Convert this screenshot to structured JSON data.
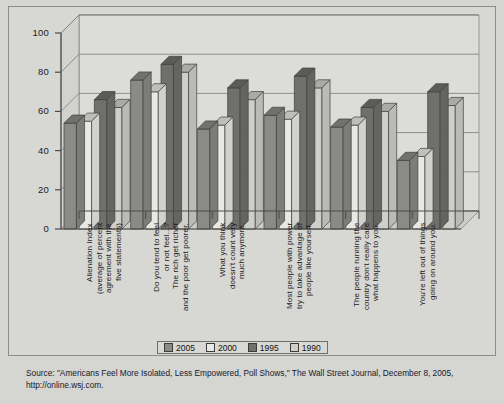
{
  "chart_data": {
    "type": "bar",
    "title": "",
    "xlabel": "",
    "ylabel": "",
    "ylim": [
      0,
      100
    ],
    "yticks": [
      0,
      20,
      40,
      60,
      80,
      100
    ],
    "grid": true,
    "legend_position": "bottom",
    "style": "3d-grouped-columns",
    "categories": [
      "Alienation Index\n(average of percent\nagreement with the\nfive statements)",
      "Do you tend to feel\nor not feel...?\nThe rich get richer\nand the poor get poorer.",
      "What you think\ndoesn't count very\nmuch anymore.",
      "Most people with power\ntry to take advantage of\npeople like yourself.",
      "The people running the\ncountry don't really care\nwhat happens to you.",
      "You're left out of things\ngoing on around you."
    ],
    "series": [
      {
        "name": "2005",
        "color": "#8a8a87",
        "values": [
          54,
          76,
          51,
          58,
          52,
          35
        ]
      },
      {
        "name": "2000",
        "color": "#e8e8e4",
        "values": [
          55,
          70,
          53,
          56,
          53,
          37
        ]
      },
      {
        "name": "1995",
        "color": "#6f6f6c",
        "values": [
          66,
          84,
          72,
          78,
          62,
          70
        ]
      },
      {
        "name": "1990",
        "color": "#cfcfca",
        "values": [
          62,
          80,
          66,
          72,
          60,
          63
        ]
      }
    ]
  },
  "legend": {
    "items": [
      {
        "label": "2005"
      },
      {
        "label": "2000"
      },
      {
        "label": "1995"
      },
      {
        "label": "1990"
      }
    ]
  },
  "source": {
    "line1": "Source: \"Americans Feel More Isolated, Less Empowered, Poll Shows,\" The Wall Street Journal, December 8, 2005,",
    "line2": "http://online.wsj.com."
  },
  "colors": {
    "page_background": "#d5d5d2",
    "plot_background": "#dedede",
    "frame_border": "#8d8d8a",
    "axis": "#4a4a48",
    "gridline": "#7b7b78",
    "text": "#1a1a1a"
  }
}
